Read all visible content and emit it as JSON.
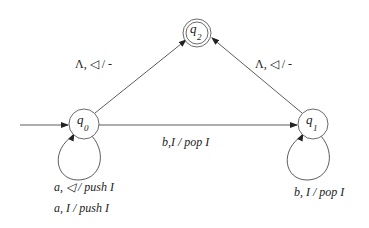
{
  "diagram": {
    "type": "pushdown-automaton",
    "states": [
      {
        "id": "q0",
        "label": "q",
        "subscript": "0",
        "initial": true,
        "accepting": false
      },
      {
        "id": "q1",
        "label": "q",
        "subscript": "1",
        "initial": false,
        "accepting": false
      },
      {
        "id": "q2",
        "label": "q",
        "subscript": "2",
        "initial": false,
        "accepting": true
      }
    ],
    "transitions": [
      {
        "from": "q0",
        "to": "q2",
        "label": "Λ, ◁ / -"
      },
      {
        "from": "q1",
        "to": "q2",
        "label": "Λ, ◁ / -"
      },
      {
        "from": "q0",
        "to": "q1",
        "label": "b,I / pop I"
      },
      {
        "from": "q0",
        "to": "q0",
        "labels": [
          "a, ◁ / push I",
          "a, I / push I"
        ]
      },
      {
        "from": "q1",
        "to": "q1",
        "label": "b, I / pop I"
      }
    ]
  },
  "labels": {
    "q0_q2": "Λ, ◁  / -",
    "q1_q2": "Λ, ◁  / -",
    "q0_q1": "b,I / pop I",
    "q0_loop_1": "a, ◁  / push I",
    "q0_loop_2": "a, I / push I",
    "q1_loop": "b, I / pop I",
    "q": "q",
    "sub0": "0",
    "sub1": "1",
    "sub2": "2"
  }
}
